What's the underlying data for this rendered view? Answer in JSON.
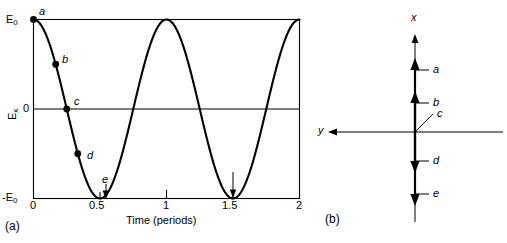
{
  "figure": {
    "panel_a": {
      "tag": "(a)",
      "y_axis_label": "E",
      "y_axis_label_sub": "x",
      "y_ticks": [
        {
          "value": 1,
          "label": "E",
          "label_sub": "0",
          "label_full": "E0"
        },
        {
          "value": 0,
          "label": "0",
          "label_sub": "",
          "label_full": "0"
        },
        {
          "value": -1,
          "label": "-E",
          "label_sub": "0",
          "label_full": "-E0"
        }
      ],
      "x_axis_label": "Time (periods)",
      "x_ticks": [
        "0",
        "0.5",
        "1",
        "1.5",
        "2"
      ],
      "points": [
        {
          "id": "a",
          "label": "a",
          "t": 0.0,
          "value": 1.0
        },
        {
          "id": "b",
          "label": "b",
          "t": 0.167,
          "value": 0.5
        },
        {
          "id": "c",
          "label": "c",
          "t": 0.25,
          "value": 0.0
        },
        {
          "id": "d",
          "label": "d",
          "t": 0.333,
          "value": -0.5
        },
        {
          "id": "e",
          "label": "e",
          "t": 0.5,
          "value": -1.0
        }
      ]
    },
    "panel_b": {
      "tag": "(b)",
      "x_axis_label": "x",
      "y_axis_label": "y",
      "vectors": [
        {
          "id": "a",
          "label": "a",
          "direction": "up",
          "magnitude": 1.0
        },
        {
          "id": "b",
          "label": "b",
          "direction": "up",
          "magnitude": 0.5
        },
        {
          "id": "c",
          "label": "c",
          "direction": "zero",
          "magnitude": 0.0
        },
        {
          "id": "d",
          "label": "d",
          "direction": "down",
          "magnitude": 0.5
        },
        {
          "id": "e",
          "label": "e",
          "direction": "down",
          "magnitude": 1.0
        }
      ]
    }
  },
  "chart_data": {
    "type": "line",
    "title": "",
    "xlabel": "Time (periods)",
    "ylabel": "Ex",
    "xlim": [
      0,
      2
    ],
    "ylim": [
      -1,
      1
    ],
    "xticks": [
      0,
      0.5,
      1,
      1.5,
      2
    ],
    "xticklabels": [
      "0",
      "0.5",
      "1",
      "1.5",
      "2"
    ],
    "yticks": [
      -1,
      0,
      1
    ],
    "yticklabels": [
      "-E0",
      "0",
      "E0"
    ],
    "grid": false,
    "legend": false,
    "series": [
      {
        "name": "Ex(t)",
        "expression": "E0 * cos(2*pi*t)",
        "x": [
          0,
          0.125,
          0.25,
          0.375,
          0.5,
          0.625,
          0.75,
          0.875,
          1.0,
          1.125,
          1.25,
          1.375,
          1.5,
          1.625,
          1.75,
          1.875,
          2.0
        ],
        "values": [
          1.0,
          0.707,
          0.0,
          -0.707,
          -1.0,
          -0.707,
          0.0,
          0.707,
          1.0,
          0.707,
          0.0,
          -0.707,
          -1.0,
          -0.707,
          0.0,
          0.707,
          1.0
        ]
      }
    ],
    "annotations": [
      {
        "label": "a",
        "x": 0.0,
        "y": 1.0
      },
      {
        "label": "b",
        "x": 0.167,
        "y": 0.5
      },
      {
        "label": "c",
        "x": 0.25,
        "y": 0.0
      },
      {
        "label": "d",
        "x": 0.333,
        "y": -0.5
      },
      {
        "label": "e",
        "x": 0.5,
        "y": -1.0
      }
    ]
  }
}
